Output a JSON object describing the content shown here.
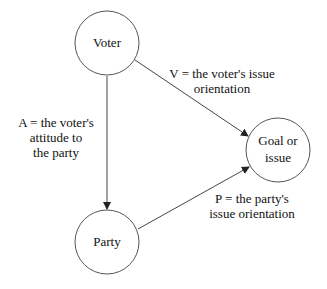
{
  "nodes": {
    "voter": {
      "label": "Voter"
    },
    "party": {
      "label": "Party"
    },
    "goal": {
      "line1": "Goal or",
      "line2": "issue"
    }
  },
  "edges": {
    "a": {
      "line1": "A = the voter's",
      "line2": "attitude to",
      "line3": "the party"
    },
    "v": {
      "line1": "V = the voter's issue",
      "line2": "orientation"
    },
    "p": {
      "line1": "P = the party's",
      "line2": "issue orientation"
    }
  },
  "colors": {
    "stroke": "#333333",
    "background": "#ffffff"
  }
}
